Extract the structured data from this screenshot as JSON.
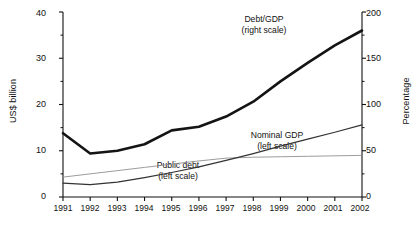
{
  "chart_data": {
    "type": "line",
    "title": "",
    "xlabel": "",
    "ylabel": "US$ billion",
    "ylabel_right": "Percentage",
    "grid": false,
    "legend_position": "inline-annotations",
    "x": [
      "1991",
      "1992",
      "1993",
      "1994",
      "1995",
      "1996",
      "1997",
      "1998",
      "1999",
      "2000",
      "2001",
      "2002"
    ],
    "ylim": [
      0,
      40
    ],
    "yticks": [
      0,
      10,
      20,
      30,
      40
    ],
    "ylim_right": [
      0,
      200
    ],
    "yticks_right": [
      0,
      50,
      100,
      150,
      200
    ],
    "yminor_right": [
      25,
      75,
      125,
      175
    ],
    "series": [
      {
        "name": "Debt/GDP",
        "scale": "right",
        "unit": "Percentage",
        "annotation": "Debt/GDP",
        "annotation_sub": "(right scale)",
        "style": "thick",
        "values": [
          69,
          47,
          50,
          57,
          72,
          76,
          87,
          103,
          125,
          145,
          164,
          180
        ]
      },
      {
        "name": "Nominal GDP",
        "scale": "left",
        "unit": "US$ billion",
        "annotation": "Nominal GDP",
        "annotation_sub": "(left scale)",
        "style": "thin",
        "values": [
          4.3,
          5.0,
          5.7,
          6.4,
          7.1,
          7.8,
          8.4,
          8.6,
          8.7,
          8.8,
          8.9,
          9.0
        ]
      },
      {
        "name": "Public debt",
        "scale": "left",
        "unit": "US$ billion",
        "annotation": "Public debt",
        "annotation_sub": "(left scale)",
        "style": "medium",
        "values": [
          3.0,
          2.7,
          3.2,
          4.2,
          5.3,
          6.5,
          7.9,
          9.4,
          11.0,
          12.5,
          14.0,
          15.6
        ]
      }
    ]
  },
  "axes": {
    "left_title": "US$ billion",
    "right_title": "Percentage",
    "left_ticks": [
      "40",
      "30",
      "20",
      "10",
      "0"
    ],
    "right_ticks": [
      "200",
      "150",
      "100",
      "50",
      "0"
    ],
    "x_ticks": [
      "1991",
      "1992",
      "1993",
      "1994",
      "1995",
      "1996",
      "1997",
      "1998",
      "1999",
      "2000",
      "2001",
      "2002"
    ]
  },
  "annotations": {
    "debt_gdp_line1": "Debt/GDP",
    "debt_gdp_line2": "(right scale)",
    "nominal_gdp_line1": "Nominal GDP",
    "nominal_gdp_line2": "(left scale)",
    "public_debt_line1": "Public debt",
    "public_debt_line2": "(left scale)"
  },
  "caption": {
    "text": ""
  },
  "colors": {
    "ink": "#111111",
    "thick_line": "#141414",
    "medium_line": "#333333",
    "thin_line": "#8a8a8a"
  }
}
